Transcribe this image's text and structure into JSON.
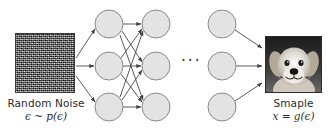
{
  "figure": {
    "background_color": "#ffffff",
    "width": 332,
    "height": 132
  },
  "left": {
    "image_name": "random-noise-patch",
    "image_description": "grayscale random noise square",
    "caption_title": "Random Noise",
    "caption_formula": "ϵ ~ p(ϵ)"
  },
  "right": {
    "image_name": "sample-dog-photo",
    "image_description": "grayscale photo of a golden retriever puppy",
    "caption_title": "Smaple",
    "caption_formula": "x = g(ϵ)"
  },
  "network": {
    "ellipsis": "···",
    "node_fill": "#e3e3e3",
    "node_stroke": "#8a8a8a",
    "edge_color": "#4a4a4a",
    "node_radius": 14,
    "layers": [
      {
        "name": "hidden-layer-1",
        "cx": 109,
        "nodes": [
          {
            "cy": 24
          },
          {
            "cy": 66
          },
          {
            "cy": 107
          }
        ]
      },
      {
        "name": "hidden-layer-2",
        "cx": 156,
        "nodes": [
          {
            "cy": 24
          },
          {
            "cy": 66
          },
          {
            "cy": 107
          }
        ]
      },
      {
        "name": "hidden-layer-n",
        "cx": 222,
        "nodes": [
          {
            "cy": 24
          },
          {
            "cy": 66
          },
          {
            "cy": 107
          }
        ]
      }
    ]
  }
}
